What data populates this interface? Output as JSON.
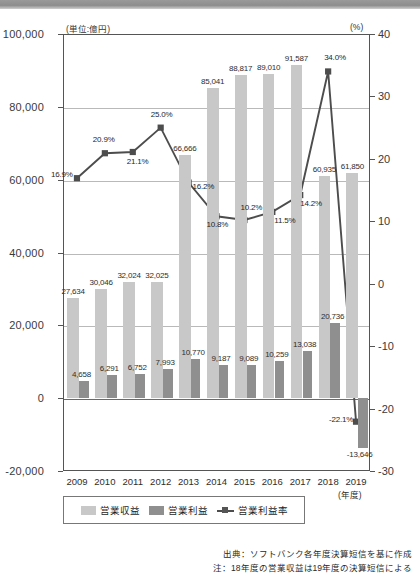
{
  "chart_data": {
    "type": "bar",
    "title": "",
    "xlabel": "(年度)",
    "unit_left": "(単位:億円)",
    "unit_right": "(%)",
    "categories": [
      "2009",
      "2010",
      "2011",
      "2012",
      "2013",
      "2014",
      "2015",
      "2016",
      "2017",
      "2018",
      "2019"
    ],
    "ylim": [
      -20000,
      100000
    ],
    "ylim_right": [
      -30,
      40
    ],
    "yticks": [
      "100,000",
      "80,000",
      "60,000",
      "40,000",
      "20,000",
      "0",
      "-20,000"
    ],
    "ytick_values": [
      100000,
      80000,
      60000,
      40000,
      20000,
      0,
      -20000
    ],
    "yticks_right": [
      "40",
      "30",
      "20",
      "10",
      "0",
      "-10",
      "-20",
      "-30"
    ],
    "ytick_values_right": [
      40,
      30,
      20,
      10,
      0,
      -10,
      -20,
      -30
    ],
    "grid": true,
    "legend_position": "bottom-left",
    "series": [
      {
        "name": "営業収益",
        "type": "bar",
        "color": "#c8c8c8",
        "axis": "left",
        "values": [
          27634,
          30046,
          32024,
          32025,
          66666,
          85041,
          88817,
          89010,
          91587,
          60935,
          61850
        ],
        "labels": [
          "27,634",
          "30,046",
          "32,024",
          "32,025",
          "66,666",
          "85,041",
          "88,817",
          "89,010",
          "91,587",
          "60,935",
          "61,850"
        ]
      },
      {
        "name": "営業利益",
        "type": "bar",
        "color": "#8f8f8f",
        "axis": "left",
        "values": [
          4658,
          6291,
          6752,
          7993,
          10770,
          9187,
          9089,
          10259,
          13038,
          20736,
          -13646
        ],
        "labels": [
          "4,658",
          "6,291",
          "6,752",
          "7,993",
          "10,770",
          "9,187",
          "9,089",
          "10,259",
          "13,038",
          "20,736",
          "-13,646"
        ]
      },
      {
        "name": "営業利益率",
        "type": "line",
        "color": "#4d4d4d",
        "axis": "right",
        "values": [
          16.9,
          20.9,
          21.1,
          25.0,
          16.2,
          10.8,
          10.2,
          11.5,
          14.2,
          34.0,
          -22.1
        ],
        "labels": [
          "16.9%",
          "20.9%",
          "21.1%",
          "25.0%",
          "16.2%",
          "10.8%",
          "10.2%",
          "11.5%",
          "14.2%",
          "34.0%",
          "-22.1%"
        ]
      }
    ]
  },
  "legend": {
    "items": [
      {
        "label": "営業収益"
      },
      {
        "label": "営業利益"
      },
      {
        "label": "営業利益率"
      }
    ]
  },
  "footer": {
    "source": "出典：ソフトバンク各年度決算短信を基に作成",
    "note": "注：18年度の営業収益は19年度の決算短信による"
  }
}
